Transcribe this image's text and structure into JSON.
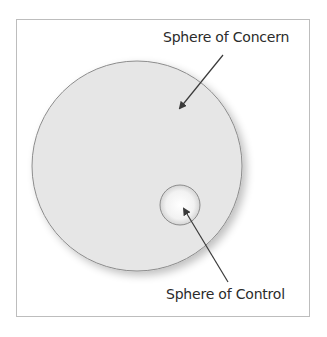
{
  "diagram": {
    "labels": {
      "concern": "Sphere of Concern",
      "control": "Sphere of Control"
    },
    "colors": {
      "frame_border": "#bdbdbd",
      "circle_fill": "#e6e6e6",
      "circle_stroke": "#8c8c8c",
      "arrow": "#3a3a3a",
      "text": "#2b2b2b"
    },
    "shapes": {
      "concern_circle": {
        "cx": 137,
        "cy": 166,
        "r": 105
      },
      "control_circle": {
        "cx": 180,
        "cy": 205,
        "r": 20
      }
    }
  }
}
